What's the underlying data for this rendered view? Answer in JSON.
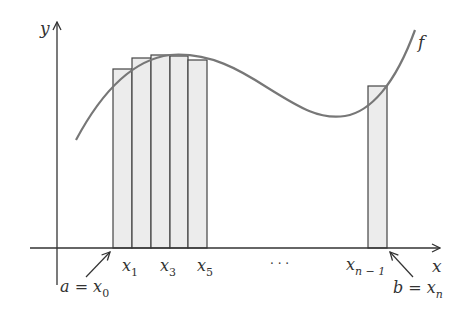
{
  "figure": {
    "function_label": "f",
    "axes": {
      "x_label": "x",
      "y_label": "y"
    },
    "colors": {
      "curve": "#777777",
      "bar_fill": "#ececec",
      "bar_stroke": "#444444",
      "axis": "#333333",
      "text": "#333333"
    }
  },
  "labels": {
    "a": "a = x",
    "a_sub": "0",
    "b": "b = x",
    "b_sub": "n",
    "x1": "x",
    "x1_sub": "1",
    "x3": "x",
    "x3_sub": "3",
    "x5": "x",
    "x5_sub": "5",
    "xn1": "x",
    "xn1_sub": "n − 1",
    "ellipsis": "· · ·"
  },
  "bars": [
    {
      "name": "bar-1",
      "x": 113,
      "width": 19,
      "top": 69
    },
    {
      "name": "bar-2",
      "x": 132,
      "width": 19,
      "top": 58
    },
    {
      "name": "bar-3",
      "x": 151,
      "width": 19,
      "top": 55
    },
    {
      "name": "bar-4",
      "x": 170,
      "width": 18,
      "top": 56
    },
    {
      "name": "bar-5",
      "x": 188,
      "width": 19,
      "top": 60
    },
    {
      "name": "bar-n",
      "x": 368,
      "width": 19,
      "top": 86
    }
  ]
}
